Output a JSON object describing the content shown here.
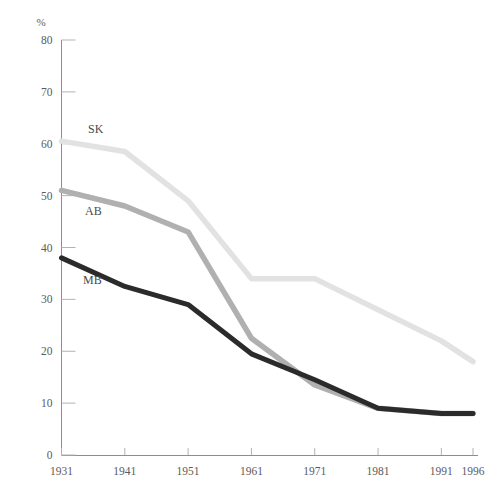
{
  "chart_data": {
    "type": "line",
    "title": "",
    "subtitle": "",
    "xlabel": "",
    "ylabel": "%",
    "unit_label": "%",
    "x": [
      1931,
      1941,
      1951,
      1961,
      1971,
      1981,
      1991,
      1996
    ],
    "xtick_labels": [
      "1931",
      "1941",
      "1951",
      "1961",
      "1971",
      "1981",
      "1991",
      "1996"
    ],
    "ytick_labels": [
      "0",
      "10",
      "20",
      "30",
      "40",
      "50",
      "60",
      "70",
      "80"
    ],
    "yticks": [
      0,
      10,
      20,
      30,
      40,
      50,
      60,
      70,
      80
    ],
    "ylim": [
      0,
      80
    ],
    "xlim": [
      1931,
      1996
    ],
    "grid": false,
    "legend_position": "inline-left",
    "series": [
      {
        "name": "SK",
        "label": "SK",
        "color": "#e2e2e2",
        "values": [
          60.5,
          58.5,
          49.0,
          34.0,
          34.0,
          28.0,
          22.0,
          18.0
        ]
      },
      {
        "name": "AB",
        "label": "AB",
        "color": "#b0b0b0",
        "values": [
          51.0,
          48.0,
          43.0,
          22.5,
          13.5,
          9.0,
          8.0,
          8.0
        ]
      },
      {
        "name": "MB",
        "label": "MB",
        "color": "#2b2b2b",
        "values": [
          38.0,
          32.5,
          29.0,
          19.5,
          14.5,
          9.0,
          8.0,
          8.0
        ]
      }
    ]
  },
  "axes": {
    "axis_color": "#8d8d8d",
    "tick_color": "#b3b3b3",
    "label_color": "#5b5b5b"
  },
  "labels": {
    "sk": "SK",
    "ab": "AB",
    "mb": "MB"
  }
}
